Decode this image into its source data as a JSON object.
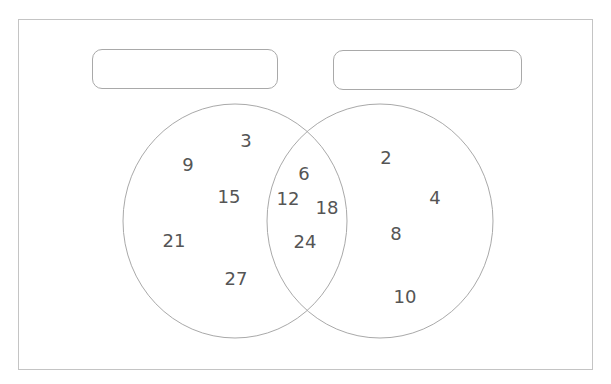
{
  "diagram": {
    "type": "venn",
    "colors": {
      "outline": "#a9a9a9",
      "text": "#555555",
      "frame": "#c4c4c4"
    },
    "set_labels": [
      "",
      ""
    ],
    "left_only": [
      {
        "value": "3",
        "x": 246,
        "y": 141
      },
      {
        "value": "9",
        "x": 188,
        "y": 165
      },
      {
        "value": "15",
        "x": 229,
        "y": 197
      },
      {
        "value": "21",
        "x": 174,
        "y": 241
      },
      {
        "value": "27",
        "x": 236,
        "y": 279
      }
    ],
    "intersection": [
      {
        "value": "6",
        "x": 304,
        "y": 174
      },
      {
        "value": "12",
        "x": 288,
        "y": 199
      },
      {
        "value": "18",
        "x": 327,
        "y": 208
      },
      {
        "value": "24",
        "x": 305,
        "y": 242
      }
    ],
    "right_only": [
      {
        "value": "2",
        "x": 386,
        "y": 158
      },
      {
        "value": "4",
        "x": 435,
        "y": 198
      },
      {
        "value": "8",
        "x": 396,
        "y": 234
      },
      {
        "value": "10",
        "x": 405,
        "y": 297
      }
    ]
  }
}
